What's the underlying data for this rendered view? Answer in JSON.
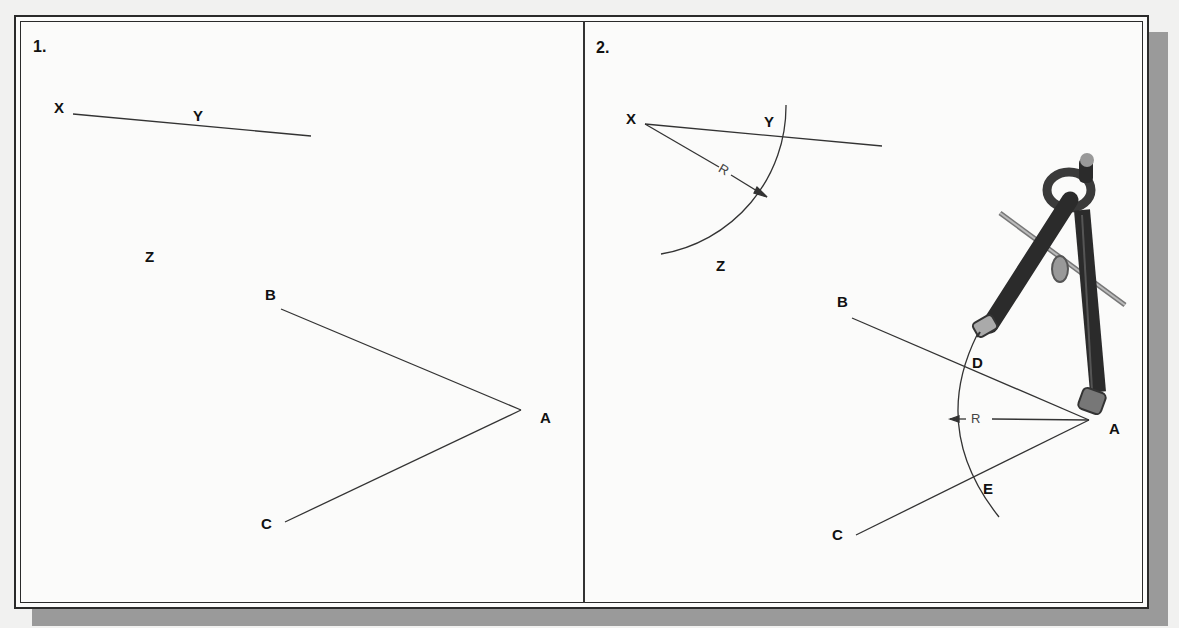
{
  "panels": [
    {
      "number": "1.",
      "labels": {
        "X": "X",
        "Y": "Y",
        "Z": "Z",
        "A": "A",
        "B": "B",
        "C": "C"
      }
    },
    {
      "number": "2.",
      "labels": {
        "X": "X",
        "Y": "Y",
        "Z": "Z",
        "A": "A",
        "B": "B",
        "C": "C",
        "D": "D",
        "E": "E"
      },
      "radius_label_1": "R",
      "radius_label_2": "R",
      "tool": "drafting compass"
    }
  ],
  "colors": {
    "line": "#333333",
    "frame": "#2a2a2a",
    "shadow": "#9a9a9a",
    "compass": "#2b2b2b"
  }
}
